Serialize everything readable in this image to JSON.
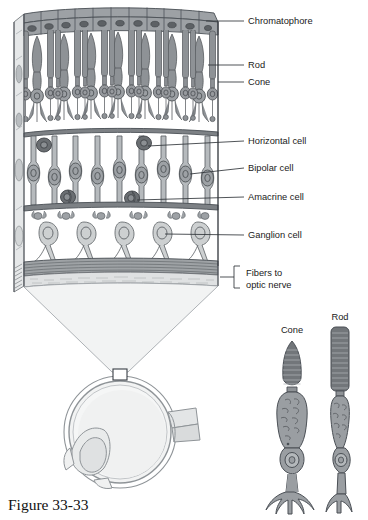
{
  "figure": {
    "caption": "Figure 33-33",
    "background_color": "#ffffff"
  },
  "palette": {
    "ink": "#4a4f55",
    "ink_dark": "#3a3f45",
    "leader": "#30353a",
    "text": "#1a1a1a",
    "chromatophore_fill": "#8b8f93",
    "chromatophore_nucleus": "#5a5e62",
    "photoreceptor_fill": "#8e9296",
    "photoreceptor_nucleus": "#6a6e72",
    "bipolar_fill": "#b3b7ba",
    "bipolar_nucleus": "#8c9094",
    "horizontal_fill": "#6f7377",
    "amacrine_fill": "#6f7377",
    "ganglion_fill": "#c9cccd",
    "ganglion_nucleus": "#aeb2b5",
    "nerve_fiber_fill": "#9a9ea1",
    "wedge_fill": "#f1f2f2",
    "eye_fill": "#f0f1f1",
    "eye_wall": "#b9bdc0",
    "detail_cell_fill": "#9a9ea2",
    "detail_outer_segment": "#6e7276",
    "side_face_fill": "#dfe1e2"
  },
  "callouts": [
    {
      "id": "chromatophore",
      "label": "Chromatophore",
      "text_x": 248,
      "text_y": 24,
      "leader_x1": 217,
      "leader_y1": 21,
      "leader_x2": 244,
      "leader_y2": 21,
      "tick_x": 207,
      "tick_y": 21,
      "has_tick": true
    },
    {
      "id": "rod",
      "label": "Rod",
      "text_x": 248,
      "text_y": 68,
      "leader_x1": 209,
      "leader_y1": 65,
      "leader_x2": 244,
      "leader_y2": 65,
      "has_tick": false
    },
    {
      "id": "cone",
      "label": "Cone",
      "text_x": 248,
      "text_y": 85,
      "leader_x1": 217,
      "leader_y1": 82,
      "leader_x2": 244,
      "leader_y2": 82,
      "has_tick": false
    },
    {
      "id": "horizontal-cell",
      "label": "Horizontal cell",
      "text_x": 248,
      "text_y": 144,
      "leader_x1": 144,
      "leader_y1": 145,
      "leader_x2": 244,
      "leader_y2": 141,
      "has_tick": false
    },
    {
      "id": "bipolar-cell",
      "label": "Bipolar cell",
      "text_x": 248,
      "text_y": 171,
      "leader_x1": 148,
      "leader_y1": 173,
      "leader_x2": 244,
      "leader_y2": 168,
      "has_tick": false
    },
    {
      "id": "amacrine-cell",
      "label": "Amacrine cell",
      "text_x": 248,
      "text_y": 200,
      "leader_x1": 133,
      "leader_y1": 199,
      "leader_x2": 244,
      "leader_y2": 197,
      "has_tick": false
    },
    {
      "id": "ganglion-cell",
      "label": "Ganglion cell",
      "text_x": 248,
      "text_y": 238,
      "leader_x1": 143,
      "leader_y1": 236,
      "leader_x2": 244,
      "leader_y2": 235,
      "has_tick": false
    }
  ],
  "bracket_callout": {
    "id": "fibers-to-optic-nerve",
    "line1": "Fibers to",
    "line2": "optic nerve",
    "text_x": 246,
    "line1_y": 273,
    "line2_y": 285,
    "bracket_x": 234,
    "bracket_top": 266,
    "bracket_bottom": 288,
    "bracket_arm": 6,
    "stem_x1": 220,
    "stem_y": 277
  },
  "retina_block": {
    "left": 14,
    "right": 218,
    "top": 8,
    "bottom": 292,
    "layers": [
      {
        "name": "chromatophore-layer",
        "top": 10,
        "bottom": 33,
        "cell_count": 11
      },
      {
        "name": "photoreceptor-layer",
        "top": 33,
        "bottom": 122
      },
      {
        "name": "outer-plexiform-layer",
        "top": 122,
        "bottom": 136
      },
      {
        "name": "inner-nuclear-layer",
        "top": 136,
        "bottom": 205
      },
      {
        "name": "inner-plexiform-layer",
        "top": 205,
        "bottom": 218
      },
      {
        "name": "ganglion-layer",
        "top": 218,
        "bottom": 262
      },
      {
        "name": "nerve-fiber-layer",
        "top": 262,
        "bottom": 292
      }
    ],
    "photoreceptor_columns": 21,
    "bipolar_columns": 10,
    "ganglion_count": 5
  },
  "magnifier_wedge": {
    "top_left_x": 24,
    "top_right_x": 214,
    "top_y": 292,
    "bottom_left_x": 112,
    "bottom_right_x": 128,
    "bottom_y": 372
  },
  "eye_diagram": {
    "center_x": 120,
    "center_y": 432,
    "radius": 56,
    "sample_box": {
      "x": 113,
      "y": 369,
      "width": 14,
      "height": 11
    },
    "optic_nerve": {
      "x": 176,
      "y": 418,
      "width": 26,
      "height": 20
    }
  },
  "detail_figures": [
    {
      "id": "cone-detail",
      "label": "Cone",
      "label_x": 292,
      "label_y": 333,
      "center_x": 292,
      "top_y": 340,
      "bottom_y": 512,
      "outer_segment": "tapered",
      "width": 26
    },
    {
      "id": "rod-detail",
      "label": "Rod",
      "label_x": 340,
      "label_y": 320,
      "center_x": 340,
      "top_y": 327,
      "bottom_y": 512,
      "outer_segment": "cylindrical",
      "width": 18
    }
  ],
  "caption_position": {
    "x": 8,
    "y": 508
  }
}
